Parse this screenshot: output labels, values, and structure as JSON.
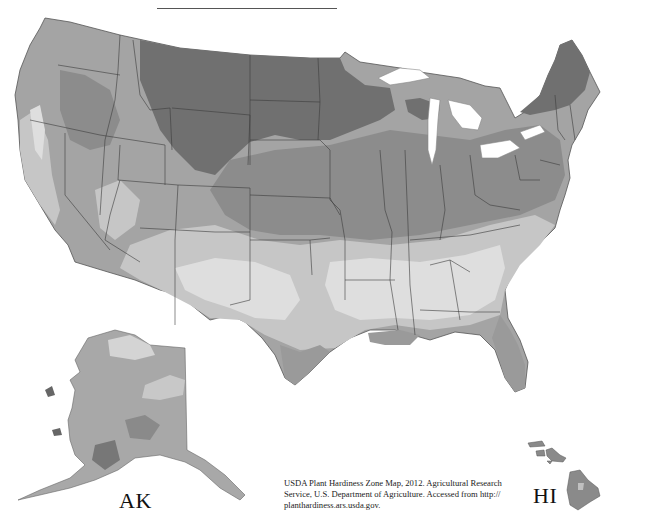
{
  "map": {
    "title": "USDA Plant Hardiness Zone Map (grayscale)",
    "region_labels": {
      "alaska": "AK",
      "hawaii": "HI"
    },
    "citation": "USDA Plant Hardiness Zone Map, 2012. Agricultural Research Service, U.S. Department of Agriculture. Accessed from http:// planthardiness.ars.usda.gov.",
    "shading": {
      "coldest": "#6e6e6e",
      "cold": "#8a8a8a",
      "mid": "#a4a4a4",
      "warm": "#c4c4c4",
      "warmest": "#dcdcdc",
      "state_border": "#3c3c3c",
      "water": "#ffffff"
    }
  }
}
